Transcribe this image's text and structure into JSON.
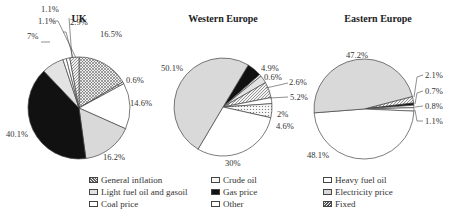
{
  "chart_data": [
    {
      "type": "pie",
      "title": "UK",
      "slices": [
        {
          "label": "General inflation",
          "value": 16.5,
          "display": "16.5%"
        },
        {
          "label": "Crude oil",
          "value": 0.6,
          "display": "0.6%"
        },
        {
          "label": "Heavy fuel oil",
          "value": 14.6,
          "display": "14.6%"
        },
        {
          "label": "Electricity price",
          "value": 16.2,
          "display": "16.2%"
        },
        {
          "label": "Gas price",
          "value": 40.1,
          "display": "40.1%"
        },
        {
          "label": "Light fuel oil and gasoil",
          "value": 7.0,
          "display": "7%"
        },
        {
          "label": "Coal price",
          "value": 1.1,
          "display": "1.1%"
        },
        {
          "label": "Other",
          "value": 1.1,
          "display": "1.1%"
        },
        {
          "label": "Fixed",
          "value": 2.9,
          "display": "2.9%"
        }
      ]
    },
    {
      "type": "pie",
      "title": "Western Europe",
      "slices": [
        {
          "label": "Gas price",
          "value": 4.9,
          "display": "4.9%"
        },
        {
          "label": "Other",
          "value": 0.6,
          "display": "0.6%"
        },
        {
          "label": "Light fuel oil and gasoil",
          "value": 2.6,
          "display": "2.6%"
        },
        {
          "label": "Fixed",
          "value": 5.2,
          "display": "5.2%"
        },
        {
          "label": "Coal price",
          "value": 2.0,
          "display": "2%"
        },
        {
          "label": "Crude oil",
          "value": 4.6,
          "display": "4.6%"
        },
        {
          "label": "Heavy fuel oil",
          "value": 30.0,
          "display": "30%"
        },
        {
          "label": "Electricity price",
          "value": 50.1,
          "display": "50.1%"
        }
      ]
    },
    {
      "type": "pie",
      "title": "Eastern Europe",
      "slices": [
        {
          "label": "Fixed",
          "value": 2.1,
          "display": "2.1%"
        },
        {
          "label": "Gas price",
          "value": 0.7,
          "display": "0.7%"
        },
        {
          "label": "Other",
          "value": 0.8,
          "display": "0.8%"
        },
        {
          "label": "Coal price",
          "value": 1.1,
          "display": "1.1%"
        },
        {
          "label": "Heavy fuel oil",
          "value": 48.1,
          "display": "48.1%"
        },
        {
          "label": "Electricity price",
          "value": 47.2,
          "display": "47.2%"
        }
      ]
    }
  ],
  "legend": [
    {
      "label": "General inflation",
      "pattern": "crosshatch"
    },
    {
      "label": "Light fuel oil and gasoil",
      "pattern": "lightgrey"
    },
    {
      "label": "Coal price",
      "pattern": "white"
    },
    {
      "label": "Crude oil",
      "pattern": "dots"
    },
    {
      "label": "Gas price",
      "pattern": "black"
    },
    {
      "label": "Other",
      "pattern": "white"
    },
    {
      "label": "Heavy fuel oil",
      "pattern": "white"
    },
    {
      "label": "Electricity price",
      "pattern": "grey"
    },
    {
      "label": "Fixed",
      "pattern": "hatch"
    }
  ],
  "colors": {
    "black": "#111111",
    "grey": "#d9d9d9",
    "lightgrey": "#e3e3e3",
    "white": "#ffffff",
    "outline": "#444444"
  }
}
